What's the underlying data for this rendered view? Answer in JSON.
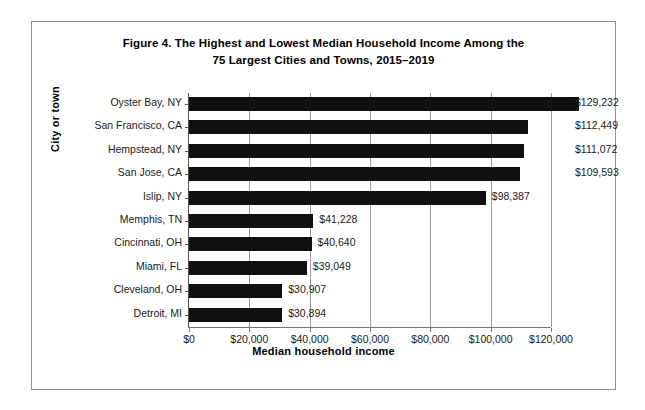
{
  "figure": {
    "title_line_1": "Figure 4. The Highest and Lowest Median Household Income Among the",
    "title_line_2": "75 Largest Cities and Towns, 2015–2019"
  },
  "chart_data": {
    "type": "bar",
    "orientation": "horizontal",
    "title": "Figure 4. The Highest and Lowest Median Household Income Among the 75 Largest Cities and Towns, 2015–2019",
    "xlabel": "Median household income",
    "ylabel": "City or town",
    "xlim": [
      0,
      120000
    ],
    "xticks": [
      0,
      20000,
      40000,
      60000,
      80000,
      100000,
      120000
    ],
    "xticklabels": [
      "$0",
      "$20,000",
      "$40,000",
      "$60,000",
      "$80,000",
      "$100,000",
      "$120,000"
    ],
    "grid": "vertical",
    "legend": "none",
    "bar_color": "#101010",
    "categories": [
      "Oyster Bay, NY",
      "San Francisco, CA",
      "Hempstead, NY",
      "San Jose, CA",
      "Islip, NY",
      "Memphis, TN",
      "Cincinnati, OH",
      "Miami, FL",
      "Cleveland, OH",
      "Detroit, MI"
    ],
    "values": [
      129232,
      112449,
      111072,
      109593,
      98387,
      41228,
      40640,
      39049,
      30907,
      30894
    ],
    "value_labels": [
      "$129,232",
      "$112,449",
      "$111,072",
      "$109,593",
      "$98,387",
      "$41,228",
      "$40,640",
      "$39,049",
      "$30,907",
      "$30,894"
    ]
  }
}
